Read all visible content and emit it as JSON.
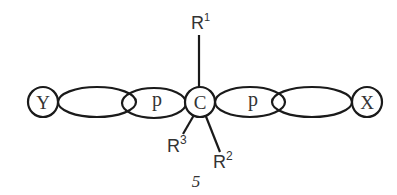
{
  "diagram": {
    "title": "",
    "nodes": {
      "left_atom": "Y",
      "center_atom": "C",
      "right_atom": "X"
    },
    "orbitals": {
      "left_p_label": "p",
      "right_p_label": "p"
    },
    "substituents": {
      "r1": {
        "base": "R",
        "sup": "1"
      },
      "r2": {
        "base": "R",
        "sup": "2"
      },
      "r3": {
        "base": "R",
        "sup": "3"
      }
    },
    "figure_number": "5"
  }
}
